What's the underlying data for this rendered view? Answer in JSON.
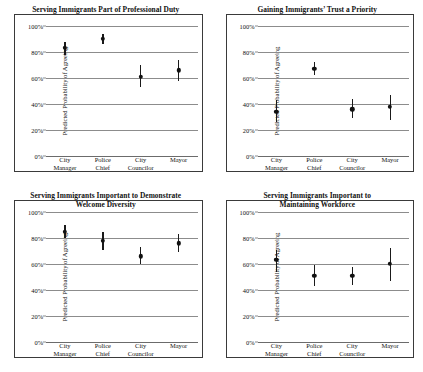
{
  "chart_data": [
    {
      "type": "scatter",
      "panel_index": 0,
      "title": "Serving Immigrants Part of Professional Duty",
      "xlabel": "",
      "ylabel": "Predicted Probability of Agreeing",
      "categories": [
        "City Manager",
        "Police Chief",
        "City Councilor",
        "Mayor"
      ],
      "category_lines": [
        [
          "City",
          "Manager"
        ],
        [
          "Police",
          "Chief"
        ],
        [
          "City",
          "Councilor"
        ],
        [
          "Mayor",
          ""
        ]
      ],
      "values": [
        83,
        90,
        61,
        66
      ],
      "errors_low": [
        78,
        86,
        53,
        58
      ],
      "errors_high": [
        88,
        94,
        70,
        74
      ],
      "ylim": [
        0,
        100
      ],
      "yticks": [
        0,
        20,
        40,
        60,
        80,
        100
      ],
      "ytick_labels": [
        "0%",
        "20%",
        "40%",
        "60%",
        "80%",
        "100%"
      ],
      "grid": true,
      "legend": "none"
    },
    {
      "type": "scatter",
      "panel_index": 1,
      "title": "Gaining Immigrants’ Trust a Priority",
      "xlabel": "",
      "ylabel": "Predicted Probability of Agreeing",
      "categories": [
        "City Manager",
        "Police Chief",
        "City Councilor",
        "Mayor"
      ],
      "category_lines": [
        [
          "City",
          "Manager"
        ],
        [
          "Police",
          "Chief"
        ],
        [
          "City",
          "Councilor"
        ],
        [
          "Mayor",
          ""
        ]
      ],
      "values": [
        34,
        67,
        36,
        38
      ],
      "errors_low": [
        26,
        62,
        29,
        28
      ],
      "errors_high": [
        43,
        72,
        44,
        47
      ],
      "ylim": [
        0,
        100
      ],
      "yticks": [
        0,
        20,
        40,
        60,
        80,
        100
      ],
      "ytick_labels": [
        "0%",
        "20%",
        "40%",
        "60%",
        "80%",
        "100%"
      ],
      "grid": true,
      "legend": "none"
    },
    {
      "type": "scatter",
      "panel_index": 2,
      "title": "Serving Immigrants Important to Demonstrate Welcome Diversity",
      "title_lines": [
        "Serving Immigrants Important to Demonstrate",
        "Welcome Diversity"
      ],
      "xlabel": "",
      "ylabel": "Predicted Probability of Agreeing",
      "categories": [
        "City Manager",
        "Police Chief",
        "City Councilor",
        "Mayor"
      ],
      "category_lines": [
        [
          "City",
          "Manager"
        ],
        [
          "Police",
          "Chief"
        ],
        [
          "City",
          "Councilor"
        ],
        [
          "Mayor",
          ""
        ]
      ],
      "values": [
        85,
        78,
        66,
        76
      ],
      "errors_low": [
        80,
        71,
        60,
        69
      ],
      "errors_high": [
        90,
        85,
        73,
        83
      ],
      "ylim": [
        0,
        100
      ],
      "yticks": [
        0,
        20,
        40,
        60,
        80,
        100
      ],
      "ytick_labels": [
        "0%",
        "20%",
        "40%",
        "60%",
        "80%",
        "100%"
      ],
      "grid": true,
      "legend": "none"
    },
    {
      "type": "scatter",
      "panel_index": 3,
      "title": "Serving Immigrants Important to Maintaining Workforce",
      "title_lines": [
        "Serving Immigrants Important to",
        "Maintaining Workforce"
      ],
      "xlabel": "",
      "ylabel": "Predicted Probability of Agreeing",
      "categories": [
        "City Manager",
        "Police Chief",
        "City Councilor",
        "Mayor"
      ],
      "category_lines": [
        [
          "City",
          "Manager"
        ],
        [
          "Police",
          "Chief"
        ],
        [
          "City",
          "Councilor"
        ],
        [
          "Mayor",
          ""
        ]
      ],
      "values": [
        63,
        51,
        51,
        60
      ],
      "errors_low": [
        54,
        43,
        44,
        47
      ],
      "errors_high": [
        71,
        59,
        58,
        72
      ],
      "ylim": [
        0,
        100
      ],
      "yticks": [
        0,
        20,
        40,
        60,
        80,
        100
      ],
      "ytick_labels": [
        "0%",
        "20%",
        "40%",
        "60%",
        "80%",
        "100%"
      ],
      "grid": true,
      "legend": "none"
    }
  ],
  "panels": [
    {
      "title": "Serving Immigrants Part of Professional Duty",
      "ylabel": "Predicted Probability of Agreeing"
    },
    {
      "title": "Gaining Immigrants’ Trust a Priority",
      "ylabel": "Predicted Probability of Agreeing"
    },
    {
      "title_line1": "Serving Immigrants Important to Demonstrate",
      "title_line2": "Welcome Diversity",
      "ylabel": "Predicted Probability of Agreeing"
    },
    {
      "title_line1": "Serving Immigrants Important to",
      "title_line2": "Maintaining Workforce",
      "ylabel": "Predicted Probability of Agreeing"
    }
  ],
  "colors": {
    "marker": "#111111",
    "gridline": "#8c8c8c",
    "frame": "#3a3a3a",
    "text": "#111111",
    "background": "#ffffff"
  }
}
